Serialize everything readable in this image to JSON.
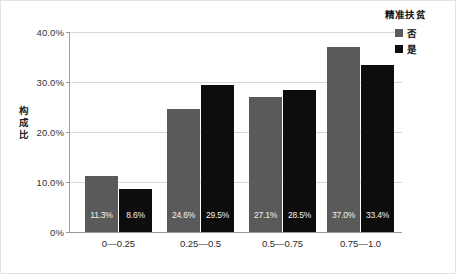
{
  "chart_data": {
    "type": "bar",
    "title": "",
    "xlabel": "",
    "ylabel": "构成比",
    "categories": [
      "0—0.25",
      "0.25—0.5",
      "0.5—0.75",
      "0.75—1.0"
    ],
    "series": [
      {
        "name": "否",
        "color": "#5a5a5a",
        "values": [
          11.3,
          24.6,
          27.1,
          37.0
        ],
        "labels": [
          "11.3%",
          "24.6%",
          "27.1%",
          "37.0%"
        ]
      },
      {
        "name": "是",
        "color": "#0d0d0d",
        "values": [
          8.6,
          29.5,
          28.5,
          33.4
        ],
        "labels": [
          "8.6%",
          "29.5%",
          "28.5%",
          "33.4%"
        ]
      }
    ],
    "ylim": [
      0,
      40
    ],
    "yticks": [
      0,
      10,
      20,
      30,
      40
    ],
    "ytick_labels": [
      "0%",
      "10.0%",
      "20.0%",
      "30.0%",
      "40.0%"
    ],
    "grid": true,
    "legend": {
      "title": "精准扶贫",
      "position": "top-right",
      "entries": [
        "否",
        "是"
      ]
    }
  }
}
